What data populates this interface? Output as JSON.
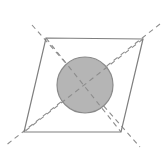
{
  "figure": {
    "title": "Parallelogram with inscribed shaded circle and dashed diagonals",
    "canvas": {
      "width": 165,
      "height": 155,
      "background_color": "#ffffff"
    },
    "colors": {
      "outline_stroke": "#7f7f7f",
      "diagonal_stroke": "#8c8c8c",
      "circle_fill": "#b5b5b5",
      "circle_stroke": "#8a8a8a",
      "background": "#ffffff"
    },
    "strokes": {
      "outline_width": 1.2,
      "diagonal_width": 1.1,
      "circle_width": 1.2,
      "dash_pattern": "5,4"
    },
    "parallelogram": {
      "name": "parallelogram",
      "vertices": [
        {
          "label": "top-left",
          "x": 46,
          "y": 38
        },
        {
          "label": "top-right",
          "x": 143,
          "y": 39
        },
        {
          "label": "bottom-right",
          "x": 121,
          "y": 132
        },
        {
          "label": "bottom-left",
          "x": 24,
          "y": 132
        }
      ],
      "points_attr": "46,38 143,39 121,132 24,132",
      "fill": "none"
    },
    "circle": {
      "name": "inscribed-circle",
      "center_x": 85,
      "center_y": 85,
      "radius": 28,
      "fill": "#b5b5b5",
      "stroke": "#8a8a8a"
    },
    "diagonals": [
      {
        "name": "diagonal-tl-br",
        "from_x": 32,
        "from_y": 25,
        "to_x": 140,
        "to_y": 147
      },
      {
        "name": "diagonal-tr-bl",
        "from_x": 160,
        "from_y": 24,
        "to_x": 5,
        "to_y": 146
      }
    ]
  }
}
